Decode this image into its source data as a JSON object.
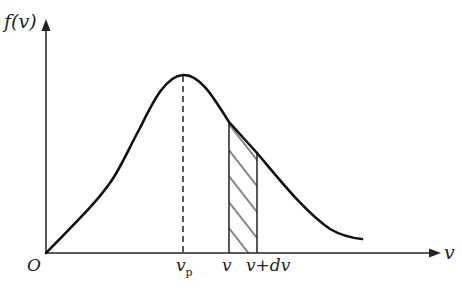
{
  "diagram": {
    "type": "maxwell-speed-distribution",
    "y_axis_label": "f(v)",
    "x_axis_label": "v",
    "origin_label": "O",
    "peak_label_main": "v",
    "peak_label_sub": "p",
    "strip_left_label": "v",
    "strip_right_label": "v+dv",
    "colors": {
      "stroke": "#111111",
      "background": "#ffffff"
    },
    "geometry": {
      "origin": [
        46,
        253
      ],
      "x_axis_end": 440,
      "y_axis_top": 20,
      "peak": [
        183,
        75
      ],
      "strip_x": [
        229,
        257
      ],
      "curve_end": [
        362,
        239
      ]
    }
  }
}
